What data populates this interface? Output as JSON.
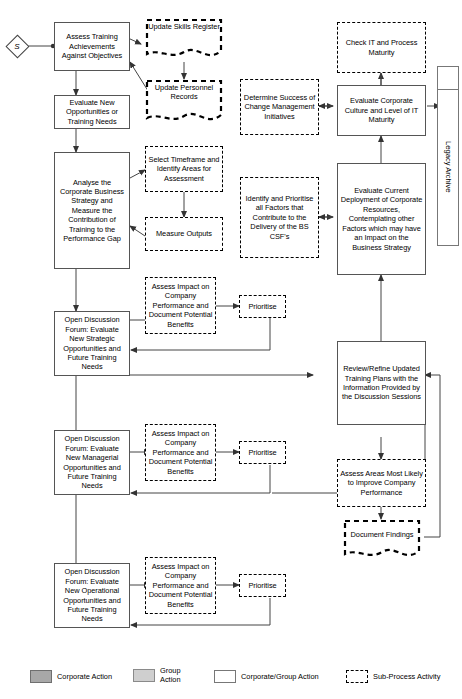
{
  "diagram": {
    "start_node": {
      "label": "S",
      "name": "start-node"
    },
    "archive": {
      "label": "Legacy Archive"
    },
    "nodes": [
      {
        "id": "assess-training",
        "label": "Assess Training Achievements Against Objectives",
        "kind": "corporate-group-action"
      },
      {
        "id": "update-skills",
        "label": "Update Skills Register",
        "kind": "sub-process-activity"
      },
      {
        "id": "update-personnel",
        "label": "Update Personnel Records",
        "kind": "sub-process-activity"
      },
      {
        "id": "check-it",
        "label": "Check IT and Process Maturity",
        "kind": "sub-process-activity"
      },
      {
        "id": "evaluate-new-opps",
        "label": "Evaluate New Opportunities or Training Needs",
        "kind": "corporate-group-action"
      },
      {
        "id": "determine-success",
        "label": "Determine Success of Change Management Initiatives",
        "kind": "sub-process-activity"
      },
      {
        "id": "evaluate-culture",
        "label": "Evaluate Corporate Culture and Level of IT Maturity",
        "kind": "corporate-group-action"
      },
      {
        "id": "analyse-corporate",
        "label": "Analyse the Corporate Business Strategy and Measure the Contribution of Training to the Performance Gap",
        "kind": "corporate-group-action"
      },
      {
        "id": "select-timeframe",
        "label": "Select Timeframe and Identify Areas for Assessment",
        "kind": "sub-process-activity"
      },
      {
        "id": "measure-outputs",
        "label": "Measure Outputs",
        "kind": "sub-process-activity"
      },
      {
        "id": "identify-prioritise",
        "label": "Identify and Prioritise all Factors that Contribute to the Delivery of the BS CSF's",
        "kind": "sub-process-activity"
      },
      {
        "id": "evaluate-deployment",
        "label": "Evaluate Current Deployment of Corporate Resources, Contemplating other Factors which may have an Impact on the Business Strategy",
        "kind": "corporate-group-action"
      },
      {
        "id": "assess-impact-1",
        "label": "Assess Impact on Company Performance and Document Potential Benefits",
        "kind": "sub-process-activity"
      },
      {
        "id": "prioritise-1",
        "label": "Prioritise",
        "kind": "sub-process-activity"
      },
      {
        "id": "forum-strategic",
        "label": "Open Discussion Forum: Evaluate New Strategic Opportunities and Future Training Needs",
        "kind": "corporate-group-action"
      },
      {
        "id": "review-refine",
        "label": "Review/Refine Updated Training Plans with the Information Provided by the Discussion Sessions",
        "kind": "corporate-group-action"
      },
      {
        "id": "assess-impact-2",
        "label": "Assess Impact on Company Performance and Document Potential Benefits",
        "kind": "sub-process-activity"
      },
      {
        "id": "prioritise-2",
        "label": "Prioritise",
        "kind": "sub-process-activity"
      },
      {
        "id": "forum-managerial",
        "label": "Open Discussion Forum: Evaluate New Managerial Opportunities and Future Training Needs",
        "kind": "corporate-group-action"
      },
      {
        "id": "assess-areas",
        "label": "Assess Areas Most Likely to Improve Company Performance",
        "kind": "sub-process-activity"
      },
      {
        "id": "document-findings",
        "label": "Document Findings",
        "kind": "sub-process-activity"
      },
      {
        "id": "assess-impact-3",
        "label": "Assess Impact on Company Performance and Document Potential Benefits",
        "kind": "sub-process-activity"
      },
      {
        "id": "prioritise-3",
        "label": "Prioritise",
        "kind": "sub-process-activity"
      },
      {
        "id": "forum-operational",
        "label": "Open Discussion Forum: Evaluate New Operational Opportunities and Future Training Needs",
        "kind": "corporate-group-action"
      }
    ]
  },
  "legend": {
    "items": [
      {
        "key": "corporate-action",
        "label": "Corporate Action",
        "color": "#a8a8a8"
      },
      {
        "key": "group-action",
        "label": "Group\nAction",
        "color": "#cfcfcf"
      },
      {
        "key": "corporate-group-action",
        "label": "Corporate/Group Action",
        "color": "#ffffff"
      },
      {
        "key": "sub-process-activity",
        "label": "Sub-Process Activity",
        "color": "#ffffff"
      }
    ]
  }
}
